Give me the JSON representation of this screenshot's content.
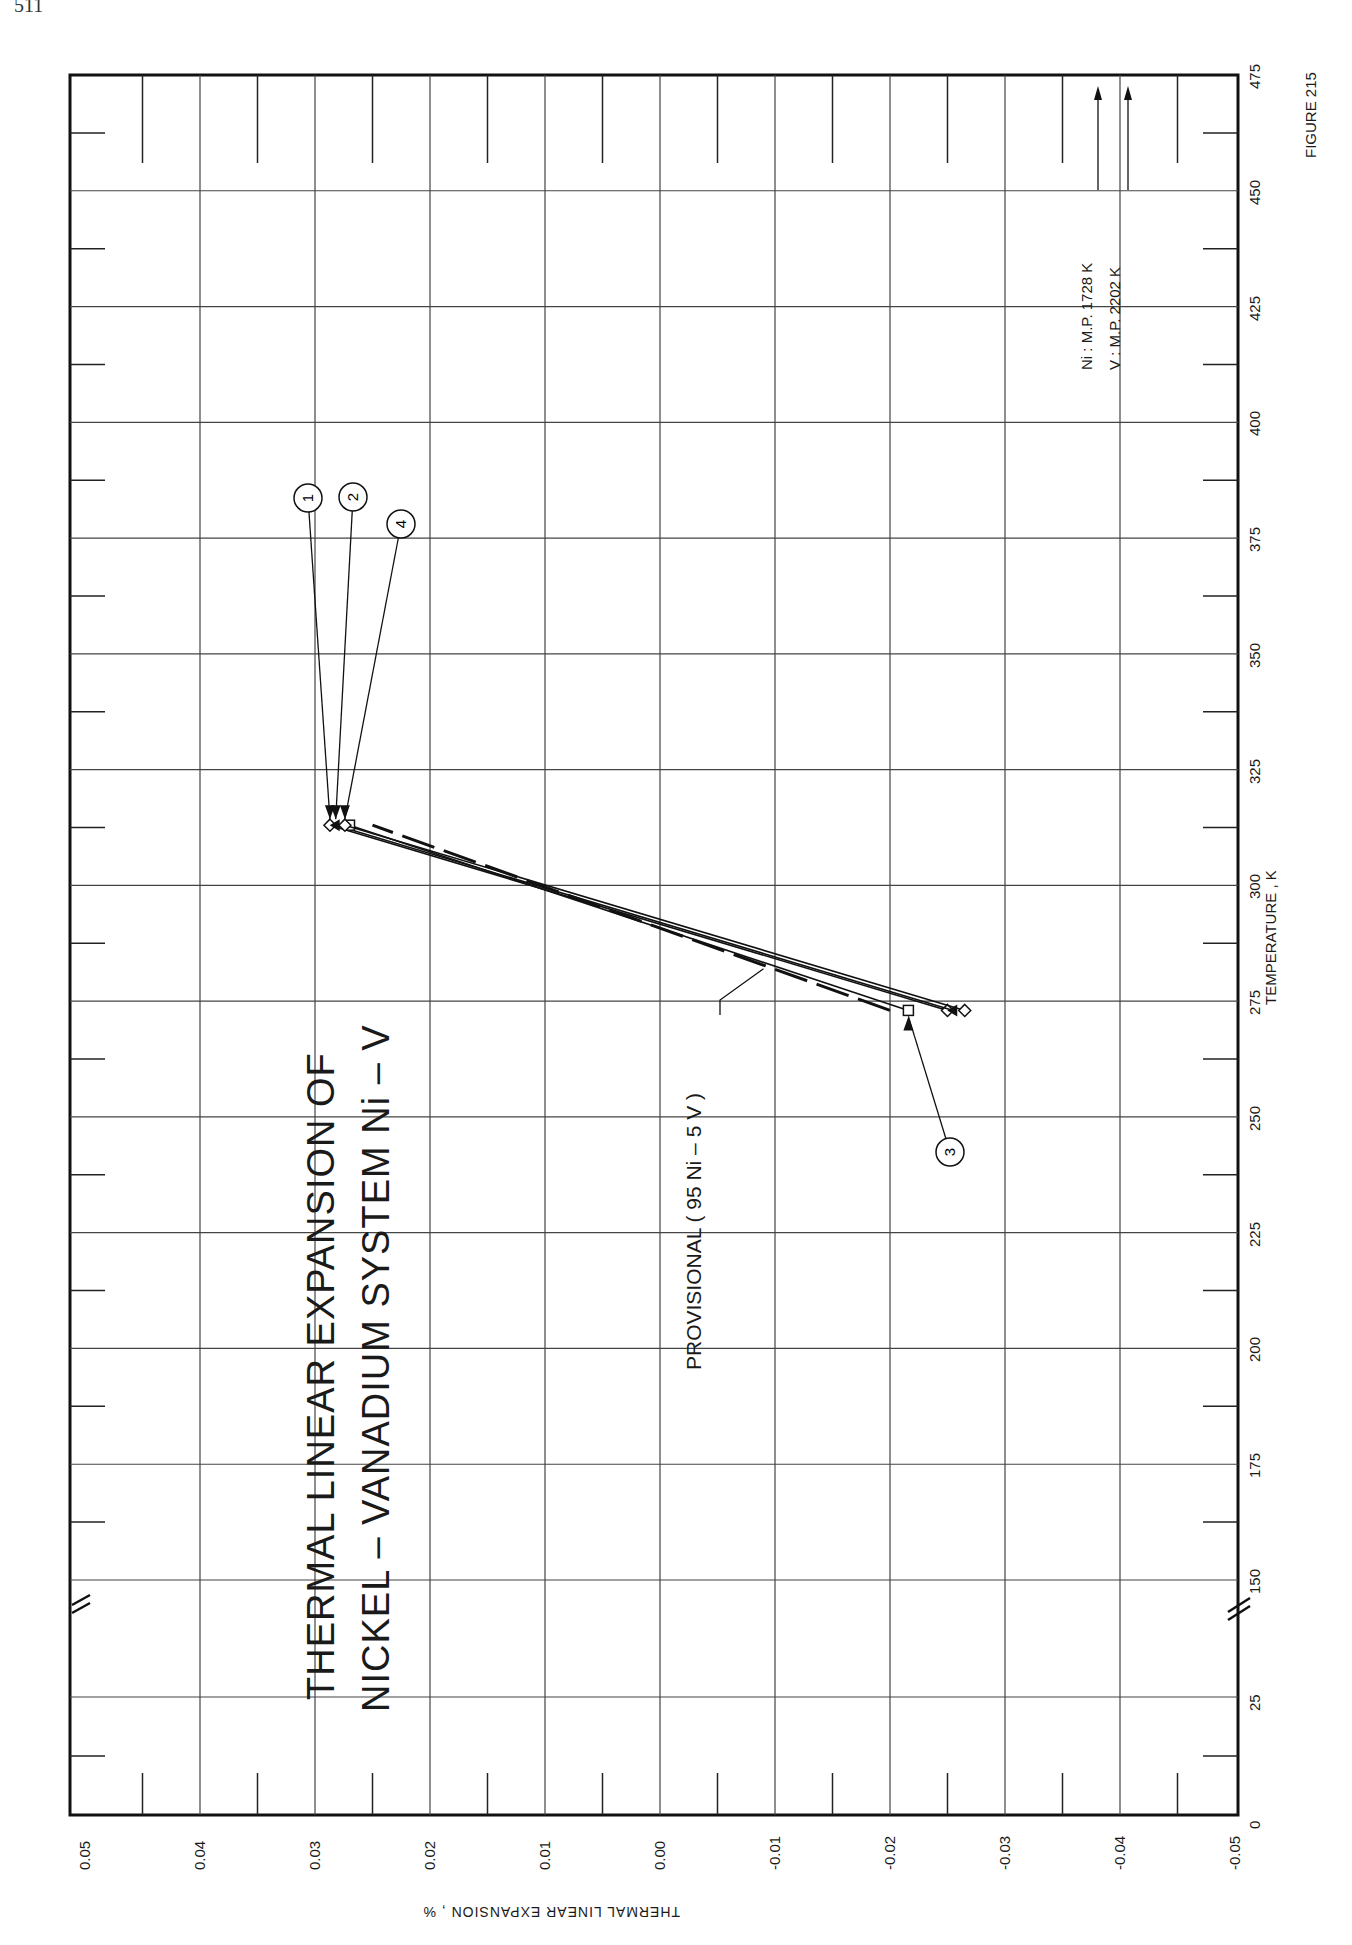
{
  "page": {
    "number_fragment": "511"
  },
  "figure": {
    "label": "FIGURE 215"
  },
  "title": {
    "line1": "THERMAL  LINEAR  EXPANSION  OF",
    "line2": "NICKEL – VANADIUM  SYSTEM    Ni – V"
  },
  "axes": {
    "x_label": "TEMPERATURE , K",
    "y_label": "THERMAL  LINEAR  EXPANSION , %",
    "x_ticks": [
      "0",
      "25",
      "150",
      "175",
      "200",
      "225",
      "250",
      "275",
      "300",
      "325",
      "350",
      "375",
      "400",
      "425",
      "450",
      "475"
    ],
    "y_ticks": [
      "0.05",
      "0.04",
      "0.03",
      "0.02",
      "0.01",
      "0.00",
      "-0.01",
      "-0.02",
      "-0.03",
      "-0.04",
      "-0.05"
    ]
  },
  "annotations": {
    "melting_points": [
      "Ni : M.P.  1728  K",
      "V : M.P.  2202  K"
    ],
    "provisional": "PROVISIONAL  ( 95 Ni – 5 V )",
    "curve_labels": [
      "1",
      "2",
      "3",
      "4"
    ]
  },
  "chart_data": {
    "type": "line",
    "xlabel": "TEMPERATURE , K",
    "ylabel": "THERMAL LINEAR EXPANSION , %",
    "xlim": [
      0,
      475
    ],
    "ylim": [
      -0.05,
      0.05
    ],
    "x_axis_break": [
      25,
      150
    ],
    "grid": true,
    "orientation": "rotated 90° on page",
    "series": [
      {
        "name": "1",
        "x": [
          273,
          313
        ],
        "y": [
          -0.025,
          0.0287
        ],
        "marker": "diamond"
      },
      {
        "name": "2",
        "x": [
          273,
          313
        ],
        "y": [
          -0.0255,
          0.0282
        ],
        "marker": "triangle"
      },
      {
        "name": "3",
        "x": [
          273,
          313
        ],
        "y": [
          -0.0216,
          0.027
        ],
        "marker": "square"
      },
      {
        "name": "4",
        "x": [
          273,
          313
        ],
        "y": [
          -0.0265,
          0.0274
        ],
        "marker": "diamond"
      },
      {
        "name": "PROVISIONAL (95 Ni - 5 V)",
        "x": [
          273,
          313
        ],
        "y": [
          -0.02,
          0.025
        ],
        "style": "dashed"
      }
    ],
    "annotations": [
      "Ni : M.P. 1728 K",
      "V : M.P. 2202 K",
      "FIGURE 215"
    ]
  }
}
